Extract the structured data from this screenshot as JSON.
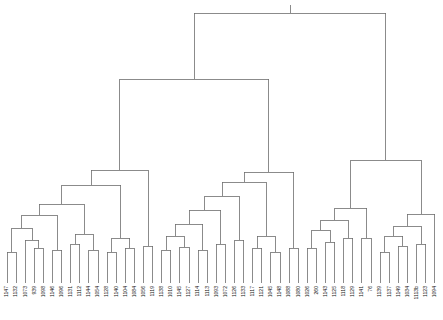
{
  "figure": {
    "title": "",
    "width": 443,
    "height": 320,
    "background": "#ffffff",
    "line_color": "#6e6e6e",
    "label_color": "#111111",
    "baseline_y": 283,
    "label_rotation_deg": -90
  },
  "chart_data": {
    "type": "dendrogram",
    "title": "",
    "xlabel": "",
    "ylabel": "",
    "orientation": "top",
    "grid": false,
    "legend": null,
    "n_leaves": 48,
    "leaf_spacing_px": 9.1,
    "leaf_start_x": 7,
    "leaf_labels": [
      "1147",
      "1132",
      "1073",
      "939",
      "1098",
      "1146",
      "1096",
      "1131",
      "1112",
      "1144",
      "1054",
      "1128",
      "1140",
      "1104",
      "1084",
      "1056",
      "1119",
      "1138",
      "1010",
      "1145",
      "1127",
      "1114",
      "1113",
      "1093",
      "1072",
      "1126",
      "1133",
      "1117",
      "1121",
      "1045",
      "1148",
      "1088",
      "1080",
      "1026",
      "260",
      "1143",
      "1125",
      "1118",
      "1129",
      "1141",
      "76",
      "1139",
      "1137",
      "1149",
      "1034",
      "1113b",
      "1123",
      "1094",
      "1122",
      "1082",
      "583",
      "1142"
    ],
    "leaf_order_x": [
      7.0,
      16.1,
      25.2,
      34.3,
      43.4,
      52.5,
      61.6,
      70.7,
      79.8,
      88.9,
      98.0,
      107.1,
      116.2,
      125.3,
      134.4,
      143.5,
      152.6,
      161.7,
      170.8,
      179.9,
      189.0,
      198.1,
      207.2,
      216.3,
      225.4,
      234.5,
      243.6,
      252.7,
      261.8,
      270.9,
      280.0,
      289.1,
      298.2,
      307.3,
      316.4,
      325.5,
      334.6,
      343.7,
      352.8,
      361.9,
      371.0,
      380.1,
      389.2,
      398.3,
      407.4,
      416.5,
      425.6,
      434.7
    ],
    "merges": [
      {
        "id": "m01",
        "x1": 7.0,
        "x2": 16.1,
        "y1": 262,
        "y2": 262,
        "y": 252
      },
      {
        "id": "m02",
        "x1": 34.3,
        "x2": 43.4,
        "y1": 258,
        "y2": 258,
        "y": 248
      },
      {
        "id": "m03",
        "x1": 25.2,
        "x2": 38.8,
        "y1": 262,
        "y2": 248,
        "y": 240
      },
      {
        "id": "m04",
        "x1": 11.5,
        "x2": 32.0,
        "y1": 252,
        "y2": 240,
        "y": 228
      },
      {
        "id": "m05",
        "x1": 52.5,
        "x2": 61.6,
        "y1": 262,
        "y2": 262,
        "y": 250
      },
      {
        "id": "m06",
        "x1": 21.8,
        "x2": 57.0,
        "y1": 228,
        "y2": 250,
        "y": 215
      },
      {
        "id": "m07",
        "x1": 70.7,
        "x2": 79.8,
        "y1": 255,
        "y2": 265,
        "y": 244
      },
      {
        "id": "m08",
        "x1": 88.9,
        "x2": 98.0,
        "y1": 258,
        "y2": 258,
        "y": 250
      },
      {
        "id": "m09",
        "x1": 75.2,
        "x2": 93.4,
        "y1": 244,
        "y2": 250,
        "y": 234
      },
      {
        "id": "m10",
        "x1": 39.4,
        "x2": 84.3,
        "y1": 215,
        "y2": 234,
        "y": 204
      },
      {
        "id": "m11",
        "x1": 107.1,
        "x2": 116.2,
        "y1": 262,
        "y2": 262,
        "y": 252
      },
      {
        "id": "m12",
        "x1": 125.3,
        "x2": 134.4,
        "y1": 258,
        "y2": 258,
        "y": 248
      },
      {
        "id": "m13",
        "x1": 111.6,
        "x2": 129.8,
        "y1": 252,
        "y2": 248,
        "y": 238
      },
      {
        "id": "m14",
        "x1": 61.8,
        "x2": 120.7,
        "y1": 204,
        "y2": 238,
        "y": 185
      },
      {
        "id": "m15",
        "x1": 143.5,
        "x2": 152.6,
        "y1": 262,
        "y2": 262,
        "y": 246
      },
      {
        "id": "m16",
        "x1": 91.2,
        "x2": 148.0,
        "y1": 185,
        "y2": 246,
        "y": 170
      },
      {
        "id": "m17",
        "x1": 161.7,
        "x2": 170.8,
        "y1": 260,
        "y2": 260,
        "y": 250
      },
      {
        "id": "m18",
        "x1": 179.9,
        "x2": 189.0,
        "y1": 258,
        "y2": 258,
        "y": 247
      },
      {
        "id": "m19",
        "x1": 166.2,
        "x2": 184.4,
        "y1": 250,
        "y2": 247,
        "y": 236
      },
      {
        "id": "m20",
        "x1": 198.1,
        "x2": 207.2,
        "y1": 262,
        "y2": 262,
        "y": 250
      },
      {
        "id": "m21",
        "x1": 175.3,
        "x2": 202.6,
        "y1": 236,
        "y2": 250,
        "y": 224
      },
      {
        "id": "m22",
        "x1": 216.3,
        "x2": 225.4,
        "y1": 258,
        "y2": 258,
        "y": 244
      },
      {
        "id": "m23",
        "x1": 189.0,
        "x2": 220.8,
        "y1": 224,
        "y2": 244,
        "y": 210
      },
      {
        "id": "m24",
        "x1": 234.5,
        "x2": 243.6,
        "y1": 254,
        "y2": 254,
        "y": 240
      },
      {
        "id": "m25",
        "x1": 204.9,
        "x2": 239.0,
        "y1": 210,
        "y2": 240,
        "y": 196
      },
      {
        "id": "m26",
        "x1": 252.7,
        "x2": 261.8,
        "y1": 258,
        "y2": 258,
        "y": 248
      },
      {
        "id": "m27",
        "x1": 270.9,
        "x2": 280.0,
        "y1": 262,
        "y2": 262,
        "y": 252
      },
      {
        "id": "m28",
        "x1": 257.2,
        "x2": 275.4,
        "y1": 248,
        "y2": 252,
        "y": 236
      },
      {
        "id": "m29",
        "x1": 222.0,
        "x2": 266.3,
        "y1": 196,
        "y2": 236,
        "y": 182
      },
      {
        "id": "m30",
        "x1": 289.1,
        "x2": 298.2,
        "y1": 260,
        "y2": 260,
        "y": 248
      },
      {
        "id": "m31",
        "x1": 244.1,
        "x2": 293.6,
        "y1": 182,
        "y2": 248,
        "y": 172
      },
      {
        "id": "m32",
        "x1": 119.6,
        "x2": 268.9,
        "y1": 170,
        "y2": 172,
        "y": 79
      },
      {
        "id": "m33",
        "x1": 307.3,
        "x2": 316.4,
        "y1": 258,
        "y2": 258,
        "y": 248
      },
      {
        "id": "m34",
        "x1": 325.5,
        "x2": 334.6,
        "y1": 256,
        "y2": 256,
        "y": 242
      },
      {
        "id": "m35",
        "x1": 311.8,
        "x2": 330.0,
        "y1": 248,
        "y2": 242,
        "y": 230
      },
      {
        "id": "m36",
        "x1": 343.7,
        "x2": 352.8,
        "y1": 250,
        "y2": 250,
        "y": 238
      },
      {
        "id": "m37",
        "x1": 320.9,
        "x2": 348.2,
        "y1": 230,
        "y2": 238,
        "y": 220
      },
      {
        "id": "m38",
        "x1": 361.9,
        "x2": 371.0,
        "y1": 248,
        "y2": 256,
        "y": 238
      },
      {
        "id": "m39",
        "x1": 334.6,
        "x2": 366.5,
        "y1": 220,
        "y2": 238,
        "y": 208
      },
      {
        "id": "m40",
        "x1": 380.1,
        "x2": 389.2,
        "y1": 262,
        "y2": 262,
        "y": 252
      },
      {
        "id": "m41",
        "x1": 398.3,
        "x2": 407.4,
        "y1": 258,
        "y2": 258,
        "y": 246
      },
      {
        "id": "m42",
        "x1": 384.6,
        "x2": 402.8,
        "y1": 252,
        "y2": 246,
        "y": 236
      },
      {
        "id": "m43",
        "x1": 416.5,
        "x2": 425.6,
        "y1": 254,
        "y2": 254,
        "y": 244
      },
      {
        "id": "m44",
        "x1": 393.7,
        "x2": 421.0,
        "y1": 236,
        "y2": 244,
        "y": 226
      },
      {
        "id": "m45",
        "x1": 434.7,
        "x2": 407.4,
        "y1": 260,
        "y2": 226,
        "y": 214
      },
      {
        "id": "m46",
        "x1": 350.5,
        "x2": 421.0,
        "y1": 208,
        "y2": 214,
        "y": 160
      },
      {
        "id": "m47",
        "x1": 194.2,
        "x2": 385.8,
        "y1": 79,
        "y2": 160,
        "y": 13
      }
    ],
    "root": {
      "x": 290.0,
      "y": 13,
      "stem_to_y": 5
    },
    "x_range": [
      0,
      443
    ],
    "y_range_px": [
      13,
      283
    ]
  }
}
